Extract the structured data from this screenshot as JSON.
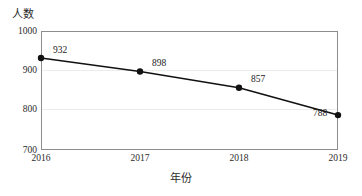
{
  "chart_data": {
    "type": "line",
    "title": "",
    "xlabel": "年份",
    "ylabel": "人数",
    "categories": [
      "2016",
      "2017",
      "2018",
      "2019"
    ],
    "values": [
      932,
      898,
      857,
      788
    ],
    "series": [
      {
        "name": "人数",
        "values": [
          932,
          898,
          857,
          788
        ]
      }
    ],
    "ylim": [
      700,
      1000
    ],
    "y_ticks": [
      "700",
      "800",
      "900",
      "1000"
    ],
    "y_tick_values": [
      700,
      800,
      900,
      1000
    ],
    "x_ticks": [
      "2016",
      "2017",
      "2018",
      "2019"
    ],
    "grid": true,
    "grid_axis": "y",
    "legend": false,
    "legend_position": "none",
    "marker": "circle",
    "line_color": "#111111",
    "marker_color": "#111111",
    "grid_color": "#ececec",
    "axis_color": "#8d8d8d",
    "data_labels": [
      "932",
      "898",
      "857",
      "788"
    ]
  }
}
